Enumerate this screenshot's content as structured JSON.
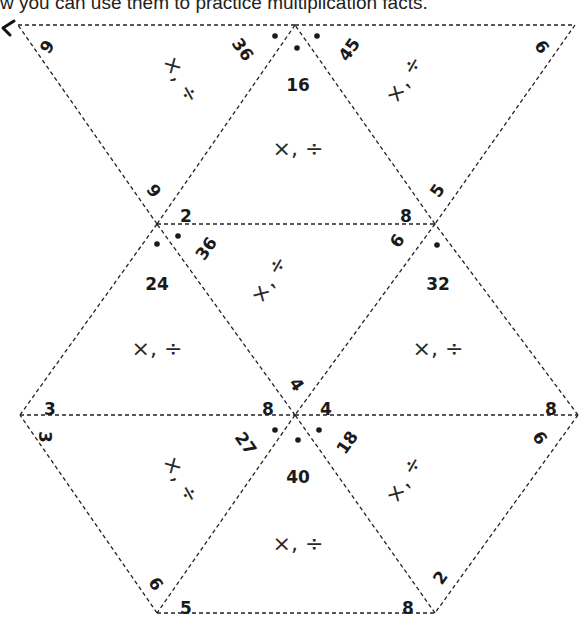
{
  "caption": "w you can use them to practice multiplication facts.",
  "operator_label": "×, ÷",
  "vertices": {
    "T0": [
      18,
      25
    ],
    "T1": [
      295,
      25
    ],
    "T2": [
      575,
      25
    ],
    "M0": [
      157,
      224
    ],
    "M1": [
      435,
      224
    ],
    "L0": [
      20,
      415
    ],
    "L1": [
      295,
      415
    ],
    "L2": [
      578,
      415
    ],
    "B0": [
      157,
      613
    ],
    "B1": [
      435,
      613
    ]
  },
  "triangles": [
    {
      "id": "top-left",
      "pts": [
        "T0",
        "T1",
        "M0"
      ],
      "orient": "down",
      "labels": [
        {
          "text": "6",
          "x": 46,
          "y": 46,
          "rot": 125
        },
        {
          "text": "36",
          "x": 242,
          "y": 50,
          "rot": 55
        },
        {
          "text": "6",
          "x": 155,
          "y": 190,
          "rot": -125
        }
      ],
      "op": {
        "x": 180,
        "y": 80,
        "rot": 60
      }
    },
    {
      "id": "top-center",
      "pts": [
        "T1",
        "M0",
        "M1"
      ],
      "orient": "up",
      "labels": [
        {
          "text": "16",
          "x": 298,
          "y": 86,
          "rot": 0
        },
        {
          "text": "2",
          "x": 186,
          "y": 217,
          "rot": 0
        },
        {
          "text": "8",
          "x": 406,
          "y": 217,
          "rot": 0
        }
      ],
      "op": {
        "x": 298,
        "y": 150,
        "rot": 0
      }
    },
    {
      "id": "top-right",
      "pts": [
        "T1",
        "T2",
        "M1"
      ],
      "orient": "down",
      "labels": [
        {
          "text": "45",
          "x": 350,
          "y": 50,
          "rot": -55
        },
        {
          "text": "9",
          "x": 543,
          "y": 46,
          "rot": -125
        },
        {
          "text": "5",
          "x": 438,
          "y": 191,
          "rot": -55
        }
      ],
      "op": {
        "x": 405,
        "y": 80,
        "rot": -60
      }
    },
    {
      "id": "mid-left",
      "pts": [
        "M0",
        "L0",
        "L1"
      ],
      "orient": "up",
      "labels": [
        {
          "text": "24",
          "x": 157,
          "y": 285,
          "rot": 0
        },
        {
          "text": "3",
          "x": 50,
          "y": 410,
          "rot": 0
        },
        {
          "text": "8",
          "x": 268,
          "y": 410,
          "rot": 0
        }
      ],
      "op": {
        "x": 157,
        "y": 350,
        "rot": 0
      }
    },
    {
      "id": "mid-center",
      "pts": [
        "M0",
        "M1",
        "L1"
      ],
      "orient": "down",
      "labels": [
        {
          "text": "36",
          "x": 207,
          "y": 249,
          "rot": -55
        },
        {
          "text": "9",
          "x": 396,
          "y": 240,
          "rot": 125
        },
        {
          "text": "4",
          "x": 296,
          "y": 385,
          "rot": 55
        }
      ],
      "op": {
        "x": 270,
        "y": 280,
        "rot": -60
      }
    },
    {
      "id": "mid-right",
      "pts": [
        "M1",
        "L1",
        "L2"
      ],
      "orient": "up",
      "labels": [
        {
          "text": "32",
          "x": 438,
          "y": 285,
          "rot": 0
        },
        {
          "text": "4",
          "x": 326,
          "y": 410,
          "rot": 0
        },
        {
          "text": "8",
          "x": 551,
          "y": 410,
          "rot": 0
        }
      ],
      "op": {
        "x": 438,
        "y": 350,
        "rot": 0
      }
    },
    {
      "id": "bottom-left",
      "pts": [
        "L0",
        "L1",
        "B0"
      ],
      "orient": "down",
      "labels": [
        {
          "text": "3",
          "x": 44,
          "y": 437,
          "rot": 90
        },
        {
          "text": "27",
          "x": 245,
          "y": 444,
          "rot": 55
        },
        {
          "text": "9",
          "x": 157,
          "y": 583,
          "rot": -125
        }
      ],
      "op": {
        "x": 180,
        "y": 480,
        "rot": 60
      }
    },
    {
      "id": "bottom-center",
      "pts": [
        "L1",
        "B0",
        "B1"
      ],
      "orient": "up",
      "labels": [
        {
          "text": "40",
          "x": 298,
          "y": 478,
          "rot": 0
        },
        {
          "text": "5",
          "x": 186,
          "y": 609,
          "rot": 0
        },
        {
          "text": "8",
          "x": 408,
          "y": 609,
          "rot": 0
        }
      ],
      "op": {
        "x": 298,
        "y": 545,
        "rot": 0
      }
    },
    {
      "id": "bottom-right",
      "pts": [
        "L1",
        "L2",
        "B1"
      ],
      "orient": "down",
      "labels": [
        {
          "text": "18",
          "x": 348,
          "y": 443,
          "rot": -55
        },
        {
          "text": "9",
          "x": 541,
          "y": 437,
          "rot": -125
        },
        {
          "text": "2",
          "x": 441,
          "y": 578,
          "rot": -55
        }
      ],
      "op": {
        "x": 405,
        "y": 480,
        "rot": -60
      }
    }
  ],
  "dots": [
    [
      275,
      36
    ],
    [
      297,
      48
    ],
    [
      317,
      36
    ],
    [
      157,
      244
    ],
    [
      178,
      236
    ],
    [
      437,
      245
    ],
    [
      275,
      430
    ],
    [
      298,
      440
    ],
    [
      319,
      430
    ]
  ]
}
